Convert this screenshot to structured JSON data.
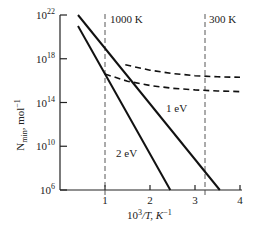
{
  "chart_data": {
    "type": "line",
    "title": "",
    "xlabel": "10³/T, K⁻¹",
    "ylabel": "N_min, mol⁻¹",
    "xlim": [
      0,
      4
    ],
    "ylim_log10": [
      6,
      22
    ],
    "y_scale": "log",
    "x_ticks": [
      1,
      2,
      3,
      4
    ],
    "x_tick_labels": [
      "1",
      "2",
      "3",
      "4"
    ],
    "y_ticks_log10": [
      6,
      10,
      14,
      18,
      22
    ],
    "y_tick_labels": [
      "10^6",
      "10^10",
      "10^14",
      "10^18",
      "10^22"
    ],
    "grid": false,
    "legend": null,
    "reference_lines": [
      {
        "label": "1000 K",
        "x": 1.0,
        "style": "dashed"
      },
      {
        "label": "300 K",
        "x": 3.33,
        "style": "dashed"
      }
    ],
    "series": [
      {
        "name": "1 eV",
        "style": "solid",
        "x": [
          0.4,
          3.55
        ],
        "log10_y": [
          22,
          6
        ]
      },
      {
        "name": "2 eV",
        "style": "solid",
        "x": [
          0.4,
          2.45
        ],
        "log10_y": [
          21.0,
          6
        ]
      },
      {
        "name": "upper dashed",
        "style": "dashed",
        "x": [
          1.45,
          2.0,
          2.5,
          3.0,
          3.5,
          4.0
        ],
        "log10_y": [
          17.45,
          16.95,
          16.65,
          16.45,
          16.35,
          16.3
        ]
      },
      {
        "name": "lower dashed",
        "style": "dashed",
        "x": [
          1.0,
          1.5,
          2.0,
          2.5,
          3.0,
          3.5,
          4.0
        ],
        "log10_y": [
          16.6,
          15.95,
          15.55,
          15.3,
          15.15,
          15.05,
          15.0
        ]
      }
    ],
    "annotations": [
      {
        "text": "1 eV",
        "x": 2.55,
        "log10_y": 13.0
      },
      {
        "text": "2 eV",
        "x": 1.35,
        "log10_y": 9.5
      }
    ]
  },
  "labels": {
    "ref_1000": "1000 K",
    "ref_300": "300 K",
    "series_1ev": "1 eV",
    "series_2ev": "2 eV",
    "xlabel_main": "10",
    "xlabel_sup": "3",
    "xlabel_rest": "/T, K",
    "xlabel_exp": "−1",
    "ylabel_main": "N",
    "ylabel_sub": "min",
    "ylabel_rest": ", mol",
    "ylabel_exp": "−1",
    "ytick_base": "10",
    "yticks": [
      "6",
      "10",
      "14",
      "18",
      "22"
    ],
    "xticks": [
      "1",
      "2",
      "3",
      "4"
    ]
  }
}
